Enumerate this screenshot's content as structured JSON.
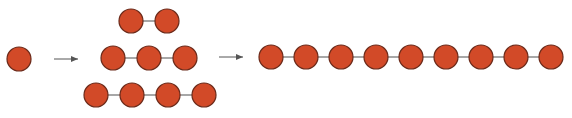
{
  "diagram": {
    "title": "",
    "colors": {
      "node_fill": "#d24a28",
      "node_stroke": "#6a2a1a",
      "edge": "#8a8a8a",
      "arrow": "#555555",
      "background": "#ffffff"
    },
    "node_radius": 12,
    "stages": [
      {
        "id": "stage-1",
        "chains": [
          {
            "length": 1,
            "y": 59,
            "x": [
              19
            ]
          }
        ]
      },
      {
        "id": "stage-2",
        "chains": [
          {
            "length": 2,
            "y": 21,
            "x": [
              131,
              167
            ]
          },
          {
            "length": 3,
            "y": 58,
            "x": [
              113,
              149,
              185
            ]
          },
          {
            "length": 4,
            "y": 95,
            "x": [
              96,
              132,
              168,
              204
            ]
          }
        ]
      },
      {
        "id": "stage-3",
        "chains": [
          {
            "length": 9,
            "y": 57,
            "x": [
              271,
              306,
              341,
              376,
              411,
              446,
              481,
              516,
              551
            ]
          }
        ]
      }
    ],
    "arrows": [
      {
        "x1": 54,
        "x2": 78,
        "y": 59
      },
      {
        "x1": 219,
        "x2": 243,
        "y": 57
      }
    ]
  }
}
